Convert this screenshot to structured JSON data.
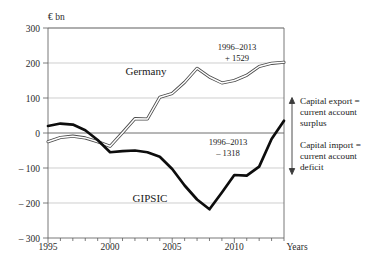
{
  "chart_data": {
    "type": "line",
    "title": "",
    "unit_label": "€ bn",
    "xlabel": "Years",
    "ylabel": "",
    "xlim": [
      1995,
      2014
    ],
    "ylim": [
      -300,
      300
    ],
    "ytick_values": [
      300,
      200,
      100,
      0,
      -100,
      -200,
      -300
    ],
    "ytick_labels": [
      "300",
      "200",
      "100",
      "0",
      "– 100",
      "– 200",
      "– 300"
    ],
    "xtick_values": [
      1995,
      2000,
      2005,
      2010
    ],
    "xtick_labels": [
      "1995",
      "2000",
      "2005",
      "2010"
    ],
    "grid": true,
    "legend_position": "inline-labels",
    "x": [
      1995,
      1996,
      1997,
      1998,
      1999,
      2000,
      2001,
      2002,
      2003,
      2004,
      2005,
      2006,
      2007,
      2008,
      2009,
      2010,
      2011,
      2012,
      2013,
      2014
    ],
    "series": [
      {
        "name": "Germany",
        "style": "double-line",
        "values": [
          -25,
          -13,
          -9,
          -14,
          -25,
          -38,
          1,
          41,
          40,
          102,
          113,
          145,
          185,
          160,
          143,
          150,
          165,
          190,
          199,
          202
        ]
      },
      {
        "name": "GIPSIC",
        "style": "thick-line",
        "values": [
          20,
          27,
          24,
          8,
          -20,
          -55,
          -52,
          -50,
          -55,
          -68,
          -103,
          -150,
          -190,
          -218,
          -170,
          -120,
          -122,
          -96,
          -17,
          35
        ]
      }
    ],
    "annotations": [
      {
        "name": "germany-cumulative",
        "line1": "1996–2013",
        "line2": "+ 1529",
        "series": "Germany"
      },
      {
        "name": "gipsic-cumulative",
        "line1": "1996–2013",
        "line2": "– 1318",
        "series": "GIPSIC"
      }
    ],
    "series_labels": [
      {
        "name": "germany-series-label",
        "text": "Germany"
      },
      {
        "name": "gipsic-series-label",
        "text": "GIPSIC"
      }
    ],
    "side_annotations": {
      "upper": {
        "line1": "Capital export =",
        "line2": "current account",
        "line3": "surplus"
      },
      "lower": {
        "line1": "Capital import =",
        "line2": "current account",
        "line3": "deficit"
      }
    },
    "colors": {
      "germany": "#4a4a4a",
      "gipsic": "#0d0d0d",
      "grid": "#b9b9b9",
      "axis": "#5d5d5d",
      "text": "#1a1a1a"
    }
  }
}
